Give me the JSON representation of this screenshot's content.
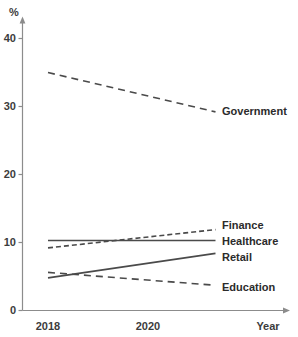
{
  "chart_data": {
    "type": "line",
    "title": "",
    "xlabel": "Year",
    "ylabel": "%",
    "x": [
      2018,
      2019,
      2020,
      2021,
      2022
    ],
    "xlim": [
      2018,
      2021.35
    ],
    "ylim": [
      0,
      43
    ],
    "xticks": [
      "2018",
      "2020"
    ],
    "xtick_values": [
      2018,
      2020
    ],
    "yticks": [
      "0",
      "10",
      "20",
      "30",
      "40"
    ],
    "ytick_values": [
      0,
      10,
      20,
      30,
      40
    ],
    "grid": false,
    "legend_position": "right-of-lines",
    "series": [
      {
        "name": "Government",
        "style": "dashed",
        "x_start": 2018,
        "x_end": 2021.35,
        "y_start": 35.0,
        "y_end": 29.2,
        "values": [
          35.0,
          33.3,
          31.5,
          29.8,
          29.2
        ]
      },
      {
        "name": "Finance",
        "style": "dashed-short",
        "x_start": 2018,
        "x_end": 2021.35,
        "y_start": 9.2,
        "y_end": 11.9,
        "values": [
          9.2,
          10.0,
          10.8,
          11.6,
          11.9
        ]
      },
      {
        "name": "Healthcare",
        "style": "solid",
        "x_start": 2018,
        "x_end": 2021.35,
        "y_start": 10.3,
        "y_end": 10.3,
        "values": [
          10.3,
          10.3,
          10.3,
          10.3,
          10.3
        ]
      },
      {
        "name": "Retail",
        "style": "solid",
        "x_start": 2018,
        "x_end": 2021.35,
        "y_start": 4.8,
        "y_end": 8.4,
        "values": [
          4.8,
          5.8,
          6.9,
          8.0,
          8.4
        ]
      },
      {
        "name": "Education",
        "style": "dashed",
        "x_start": 2018,
        "x_end": 2021.35,
        "y_start": 5.6,
        "y_end": 3.7,
        "values": [
          5.6,
          5.0,
          4.5,
          3.9,
          3.7
        ]
      }
    ],
    "colors": {
      "line": "#4a4a4a",
      "axis": "#8c8c8c",
      "text": "#2b2b2b",
      "background": "#ffffff"
    }
  },
  "axis": {
    "y_label": "%",
    "x_label": "Year",
    "y_tick_0": "0",
    "y_tick_10": "10",
    "y_tick_20": "20",
    "y_tick_30": "30",
    "y_tick_40": "40",
    "x_tick_2018": "2018",
    "x_tick_2020": "2020"
  },
  "labels": {
    "government": "Government",
    "finance": "Finance",
    "healthcare": "Healthcare",
    "retail": "Retail",
    "education": "Education"
  }
}
